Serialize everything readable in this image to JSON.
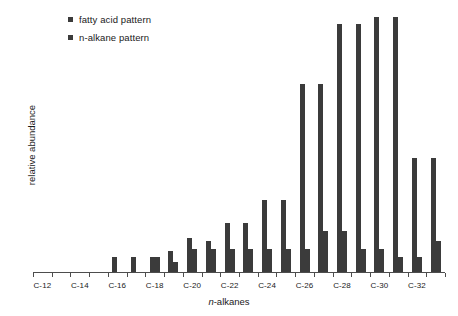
{
  "legend": {
    "position": "top-left",
    "items": [
      {
        "label": "fatty acid pattern",
        "color": "#3b3b3b",
        "marker": "square-marker"
      },
      {
        "label": "n-alkane pattern",
        "color": "#3b3b3b",
        "marker": "square-marker"
      }
    ]
  },
  "axes": {
    "ylabel": "relative abundance",
    "xlabel_italic": "n",
    "xlabel_rest": "-alkanes",
    "xlabel_full": "n-alkanes"
  },
  "chart_data": {
    "type": "bar",
    "title": "",
    "xlabel": "n-alkanes",
    "ylabel": "relative abundance",
    "ylim": [
      0,
      100
    ],
    "grid": false,
    "legend_position": "top-left",
    "bar_color": "#3b3b3b",
    "categories": [
      "C-12",
      "C-13",
      "C-14",
      "C-15",
      "C-16",
      "C-17",
      "C-18",
      "C-19",
      "C-20",
      "C-21",
      "C-22",
      "C-23",
      "C-24",
      "C-25",
      "C-26",
      "C-27",
      "C-28",
      "C-29",
      "C-30",
      "C-31",
      "C-32",
      "C-33"
    ],
    "tick_labels": [
      "C-12",
      "",
      "C-14",
      "",
      "C-16",
      "",
      "C-18",
      "",
      "C-20",
      "",
      "C-22",
      "",
      "C-24",
      "",
      "C-26",
      "",
      "C-28",
      "",
      "C-30",
      "",
      "C-32",
      ""
    ],
    "series": [
      {
        "name": "fatty acid pattern",
        "values": [
          0,
          0,
          0,
          0,
          6,
          6,
          6,
          8,
          13,
          12,
          19,
          19,
          28,
          28,
          73,
          73,
          96,
          96,
          99,
          99,
          44,
          44
        ]
      },
      {
        "name": "n-alkane pattern",
        "values": [
          0,
          0,
          0,
          0,
          0,
          0,
          6,
          4,
          9,
          9,
          9,
          9,
          9,
          9,
          9,
          16,
          16,
          9,
          9,
          6,
          6,
          12
        ]
      }
    ]
  },
  "bars": [
    {
      "name": "C-16-fatty-acid",
      "x": 99,
      "h": 23
    },
    {
      "name": "C-18-fatty-acid",
      "x": 133,
      "h": 23
    },
    {
      "name": "C-18-n-alkane",
      "x": 142,
      "h": 22
    },
    {
      "name": "C-19-fatty-acid",
      "x": 156,
      "h": 23
    },
    {
      "name": "C-20-fatty-acid",
      "x": 170,
      "h": 31
    },
    {
      "name": "C-20-n-alkane",
      "x": 179,
      "h": 17
    },
    {
      "name": "C-21-fatty-acid",
      "x": 193,
      "h": 47
    },
    {
      "name": "C-21-n-alkane",
      "x": 202,
      "h": 34
    },
    {
      "name": "C-22-fatty-acid",
      "x": 216,
      "h": 39
    },
    {
      "name": "C-22-n-alkane",
      "x": 225,
      "h": 34
    },
    {
      "name": "C-23-fatty-acid",
      "x": 239,
      "h": 66
    },
    {
      "name": "C-23-n-alkane",
      "x": 248,
      "h": 31
    },
    {
      "name": "C-24-fatty-acid",
      "x": 262,
      "h": 66
    },
    {
      "name": "C-24-n-alkane",
      "x": 271,
      "h": 31
    },
    {
      "name": "C-25-fatty-acid",
      "x": 285,
      "h": 102
    },
    {
      "name": "C-25-n-alkane",
      "x": 294,
      "h": 31
    },
    {
      "name": "C-26-fatty-acid",
      "x": 308,
      "h": 102
    },
    {
      "name": "C-26-n-alkane",
      "x": 317,
      "h": 31
    },
    {
      "name": "C-27-fatty-acid",
      "x": 331,
      "h": 243
    },
    {
      "name": "C-27-n-alkane",
      "x": 340,
      "h": 31
    },
    {
      "name": "C-28-fatty-acid",
      "x": 354,
      "h": 238
    },
    {
      "name": "C-28-n-alkane",
      "x": 363,
      "h": 48
    },
    {
      "name": "C-29-fatty-acid",
      "x": 377,
      "h": 253
    },
    {
      "name": "C-29-n-alkane",
      "x": 386,
      "h": 48
    },
    {
      "name": "C-30-fatty-acid",
      "x": 400,
      "h": 254
    },
    {
      "name": "C-30-n-alkane",
      "x": 409,
      "h": 31
    },
    {
      "name": "C-31-fatty-acid",
      "x": 423,
      "h": 123
    },
    {
      "name": "C-31-n-alkane",
      "x": 432,
      "h": 31
    },
    {
      "name": "C-32-fatty-acid",
      "x": 446,
      "h": 123
    },
    {
      "name": "C-32-n-alkane",
      "x": 455,
      "h": 18
    },
    {
      "name": "C-33-fatty-acid",
      "x": 469,
      "h": 44
    },
    {
      "name": "C-33-n-alkane",
      "x": 478,
      "h": 22
    }
  ]
}
